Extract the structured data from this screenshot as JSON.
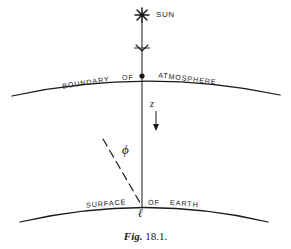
{
  "figure": {
    "caption_italic": "Fig.",
    "caption_rest": " 18.1.",
    "caption_full": "Fig. 18.1."
  },
  "labels": {
    "sun": "SUN",
    "boundary": "BOUNDARY",
    "of_atmosphere": "OF",
    "atmosphere": "ATMOSPHERE",
    "surface": "SURFACE",
    "of_earth": "OF",
    "earth": "EARTH",
    "zenith_distance": "z",
    "angle_phi": "ϕ",
    "point_l": "ℓ"
  },
  "icons": {
    "sun_symbol": "sun-asterisk-icon",
    "ray_arrow": "downward-ray-arrow-icon",
    "depth_arrow": "downward-depth-arrow-icon",
    "boundary_node": "intersection-dot-icon"
  },
  "colors": {
    "ink": "#1a1a1a",
    "background": "#ffffff"
  },
  "geometry": {
    "atmosphere_arc": "M 12 96 Q 146 67 280 95",
    "earth_arc": "M 20 222 Q 146 193 268 222",
    "sun_ray": "M 142 20 L 142 206",
    "slant_dashed_ray": "M 103 139 L 142 206",
    "depth_arrow": "M 156 112 L 156 130",
    "ray_arrow_tick": "M 135 48 L 149 48"
  }
}
